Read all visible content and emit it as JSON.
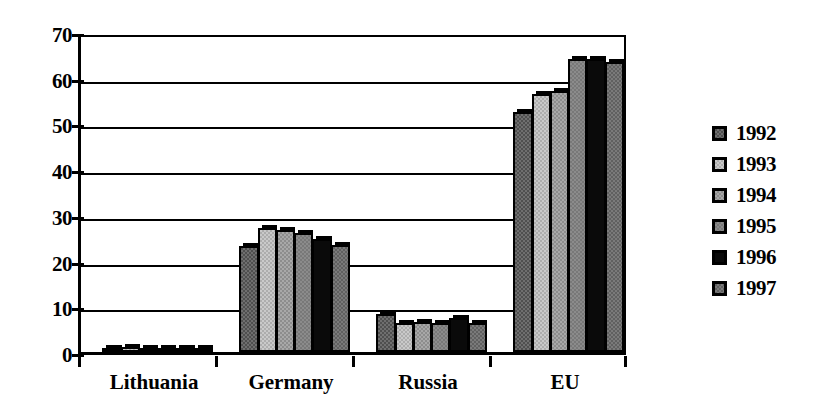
{
  "chart_data": {
    "type": "bar",
    "title": "",
    "subtitle": "",
    "xlabel": "",
    "ylabel": "",
    "categories": [
      "Lithuania",
      "Germany",
      "Russia",
      "EU"
    ],
    "series": [
      {
        "name": "1992",
        "color": "#4f4f4f",
        "values": [
          0.8,
          23.2,
          8.3,
          52.5
        ]
      },
      {
        "name": "1993",
        "color": "#c9c9c9",
        "values": [
          1.0,
          27.2,
          6.3,
          56.5
        ]
      },
      {
        "name": "1994",
        "color": "#a8a8a8",
        "values": [
          0.7,
          26.8,
          6.6,
          57.0
        ]
      },
      {
        "name": "1995",
        "color": "#787878",
        "values": [
          0.6,
          26.0,
          6.3,
          64.0
        ]
      },
      {
        "name": "1996",
        "color": "#0a0a0a",
        "values": [
          0.7,
          24.8,
          7.4,
          64.2
        ]
      },
      {
        "name": "1997",
        "color": "#606060",
        "values": [
          0.6,
          23.4,
          6.3,
          63.4
        ]
      }
    ],
    "yticks": [
      0,
      10,
      20,
      30,
      40,
      50,
      60,
      70
    ],
    "ytick_labels": [
      "0",
      "10",
      "20",
      "30",
      "40",
      "50",
      "60",
      "70"
    ],
    "ylim": [
      0,
      70
    ],
    "grid": true,
    "grid_axis": "y",
    "legend": {
      "position": "right",
      "entries": [
        "1992",
        "1993",
        "1994",
        "1995",
        "1996",
        "1997"
      ]
    }
  },
  "legend": {
    "items": [
      {
        "label": "1992"
      },
      {
        "label": "1993"
      },
      {
        "label": "1994"
      },
      {
        "label": "1995"
      },
      {
        "label": "1996"
      },
      {
        "label": "1997"
      }
    ]
  },
  "axes": {
    "y": {
      "labels": [
        "70",
        "60",
        "50",
        "40",
        "30",
        "20",
        "10",
        "0"
      ]
    },
    "x": {
      "labels": [
        "Lithuania",
        "Germany",
        "Russia",
        "EU"
      ]
    }
  }
}
